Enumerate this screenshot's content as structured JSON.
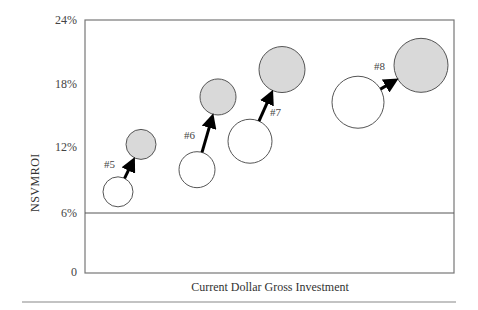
{
  "chart_data": {
    "type": "scatter",
    "subtype": "bubble",
    "title": "",
    "xlabel": "Current Dollar Gross Investment",
    "ylabel": "NSVMROI",
    "yticks": [
      "0",
      "6%",
      "12%",
      "18%",
      "24%"
    ],
    "ylim": [
      0,
      24
    ],
    "reference_line": {
      "y": 6,
      "label": "6%"
    },
    "grid": false,
    "legend": null,
    "series": [
      {
        "name": "#5",
        "from": {
          "x_px": 118,
          "y": 7.7,
          "size": 15
        },
        "to": {
          "x_px": 141,
          "y": 12.2,
          "size": 15
        }
      },
      {
        "name": "#6",
        "from": {
          "x_px": 197,
          "y": 9.8,
          "size": 18
        },
        "to": {
          "x_px": 218,
          "y": 16.7,
          "size": 18
        }
      },
      {
        "name": "#7",
        "from": {
          "x_px": 250,
          "y": 12.5,
          "size": 22
        },
        "to": {
          "x_px": 282,
          "y": 19.3,
          "size": 23
        }
      },
      {
        "name": "#8",
        "from": {
          "x_px": 358,
          "y": 16.2,
          "size": 26
        },
        "to": {
          "x_px": 421,
          "y": 19.7,
          "size": 27
        }
      }
    ],
    "colors": {
      "before_fill": "#ffffff",
      "after_fill": "#d9d9d9",
      "stroke": "#555555",
      "arrow": "#000000"
    }
  },
  "labels": {
    "y_axis": "NSVMROI",
    "x_axis": "Current Dollar Gross Investment",
    "ticks": [
      "24%",
      "18%",
      "12%",
      "6%",
      "0"
    ],
    "points": [
      "#5",
      "#6",
      "#7",
      "#8"
    ]
  }
}
